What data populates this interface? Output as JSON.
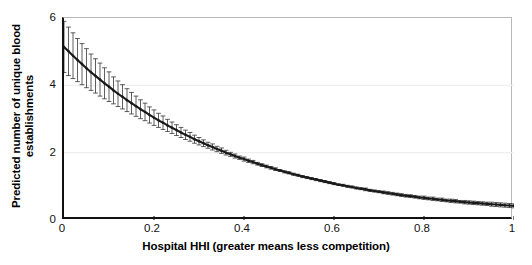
{
  "chart_data": {
    "type": "line",
    "title": "",
    "subtitle": "",
    "xlabel": "Hospital HHI (greater means less competition)",
    "ylabel": "Predicted number of unique blood establishments",
    "ylabel_line1": "Predicted number of unique blood",
    "ylabel_line2": "establishments",
    "xlim": [
      0,
      1
    ],
    "ylim": [
      0,
      6
    ],
    "xticks": [
      0,
      0.2,
      0.4,
      0.6,
      0.8,
      1
    ],
    "xticklabels": [
      "0",
      "0.2",
      "0.4",
      "0.6",
      "0.8",
      "1"
    ],
    "yticks": [
      0,
      2,
      4,
      6
    ],
    "yticklabels": [
      "0",
      "2",
      "4",
      "6"
    ],
    "grid": "horizontal-faint",
    "legend": "none",
    "markers": "small filled circles",
    "errorbars": "capped vertical 95% confidence intervals at every point",
    "series": [
      {
        "name": "Predicted number of unique blood establishments",
        "color": "#1a1a1a",
        "x": [
          0.0,
          0.01,
          0.02,
          0.03,
          0.04,
          0.05,
          0.06,
          0.07,
          0.08,
          0.09,
          0.1,
          0.11,
          0.12,
          0.13,
          0.14,
          0.15,
          0.16,
          0.17,
          0.18,
          0.19,
          0.2,
          0.21,
          0.22,
          0.23,
          0.24,
          0.25,
          0.26,
          0.27,
          0.28,
          0.29,
          0.3,
          0.31,
          0.32,
          0.33,
          0.34,
          0.35,
          0.36,
          0.37,
          0.38,
          0.39,
          0.4,
          0.41,
          0.42,
          0.43,
          0.44,
          0.45,
          0.46,
          0.47,
          0.48,
          0.49,
          0.5,
          0.51,
          0.52,
          0.53,
          0.54,
          0.55,
          0.56,
          0.57,
          0.58,
          0.59,
          0.6,
          0.61,
          0.62,
          0.63,
          0.64,
          0.65,
          0.66,
          0.67,
          0.68,
          0.69,
          0.7,
          0.71,
          0.72,
          0.73,
          0.74,
          0.75,
          0.76,
          0.77,
          0.78,
          0.79,
          0.8,
          0.81,
          0.82,
          0.83,
          0.84,
          0.85,
          0.86,
          0.87,
          0.88,
          0.89,
          0.9,
          0.91,
          0.92,
          0.93,
          0.94,
          0.95,
          0.96,
          0.97,
          0.98,
          0.99,
          1.0
        ],
        "y": [
          5.14,
          5.01,
          4.88,
          4.75,
          4.63,
          4.51,
          4.39,
          4.28,
          4.17,
          4.06,
          3.96,
          3.85,
          3.75,
          3.66,
          3.56,
          3.47,
          3.38,
          3.29,
          3.21,
          3.12,
          3.04,
          2.96,
          2.89,
          2.81,
          2.74,
          2.67,
          2.6,
          2.53,
          2.47,
          2.4,
          2.34,
          2.28,
          2.22,
          2.17,
          2.11,
          2.06,
          2.0,
          1.95,
          1.9,
          1.85,
          1.81,
          1.76,
          1.72,
          1.67,
          1.63,
          1.59,
          1.55,
          1.51,
          1.47,
          1.43,
          1.4,
          1.36,
          1.33,
          1.29,
          1.26,
          1.23,
          1.2,
          1.17,
          1.14,
          1.11,
          1.08,
          1.05,
          1.03,
          1.0,
          0.98,
          0.95,
          0.93,
          0.91,
          0.88,
          0.86,
          0.84,
          0.82,
          0.8,
          0.78,
          0.76,
          0.74,
          0.72,
          0.71,
          0.69,
          0.67,
          0.66,
          0.64,
          0.63,
          0.61,
          0.6,
          0.58,
          0.57,
          0.56,
          0.54,
          0.53,
          0.52,
          0.51,
          0.5,
          0.49,
          0.48,
          0.47,
          0.46,
          0.45,
          0.44,
          0.43,
          0.42
        ],
        "ci_low": [
          4.38,
          4.29,
          4.2,
          4.11,
          4.02,
          3.93,
          3.85,
          3.77,
          3.68,
          3.6,
          3.52,
          3.45,
          3.37,
          3.3,
          3.22,
          3.15,
          3.08,
          3.01,
          2.95,
          2.88,
          2.81,
          2.75,
          2.69,
          2.63,
          2.57,
          2.51,
          2.45,
          2.39,
          2.34,
          2.28,
          2.23,
          2.18,
          2.13,
          2.08,
          2.03,
          1.98,
          1.93,
          1.89,
          1.84,
          1.8,
          1.75,
          1.71,
          1.67,
          1.63,
          1.59,
          1.55,
          1.51,
          1.47,
          1.44,
          1.4,
          1.37,
          1.33,
          1.3,
          1.26,
          1.23,
          1.2,
          1.17,
          1.14,
          1.11,
          1.08,
          1.05,
          1.03,
          1.0,
          0.97,
          0.95,
          0.92,
          0.9,
          0.87,
          0.85,
          0.83,
          0.81,
          0.78,
          0.76,
          0.74,
          0.72,
          0.7,
          0.68,
          0.67,
          0.65,
          0.63,
          0.61,
          0.6,
          0.58,
          0.57,
          0.55,
          0.54,
          0.52,
          0.51,
          0.5,
          0.48,
          0.47,
          0.46,
          0.45,
          0.44,
          0.43,
          0.41,
          0.4,
          0.39,
          0.38,
          0.37,
          0.36
        ],
        "ci_high": [
          5.9,
          5.73,
          5.56,
          5.39,
          5.24,
          5.09,
          4.93,
          4.79,
          4.66,
          4.52,
          4.4,
          4.25,
          4.13,
          4.02,
          3.9,
          3.79,
          3.68,
          3.57,
          3.47,
          3.36,
          3.27,
          3.17,
          3.09,
          2.99,
          2.91,
          2.83,
          2.75,
          2.67,
          2.6,
          2.52,
          2.45,
          2.38,
          2.31,
          2.26,
          2.19,
          2.14,
          2.07,
          2.01,
          1.96,
          1.9,
          1.87,
          1.81,
          1.77,
          1.71,
          1.67,
          1.63,
          1.59,
          1.55,
          1.5,
          1.46,
          1.43,
          1.39,
          1.36,
          1.32,
          1.29,
          1.26,
          1.23,
          1.2,
          1.17,
          1.14,
          1.11,
          1.07,
          1.06,
          1.03,
          1.01,
          0.98,
          0.96,
          0.95,
          0.91,
          0.89,
          0.87,
          0.86,
          0.84,
          0.82,
          0.8,
          0.78,
          0.76,
          0.75,
          0.73,
          0.71,
          0.71,
          0.68,
          0.68,
          0.65,
          0.65,
          0.62,
          0.62,
          0.61,
          0.58,
          0.58,
          0.57,
          0.56,
          0.55,
          0.54,
          0.53,
          0.53,
          0.52,
          0.51,
          0.5,
          0.49,
          0.48
        ]
      }
    ]
  },
  "axes": {
    "ytick_labels": [
      "6",
      "4",
      "2",
      "0"
    ],
    "xtick_labels": [
      "0",
      "0.2",
      "0.4",
      "0.6",
      "0.8",
      "1"
    ],
    "xlabel": "Hospital HHI (greater means less competition)",
    "ylabel_line1": "Predicted number of unique blood",
    "ylabel_line2": "establishments"
  },
  "colors": {
    "line": "#1a1a1a",
    "errorbar": "#2a2a2a",
    "axis": "#111111",
    "frame": "#b9b9b9",
    "grid": "#efefef",
    "background": "#ffffff"
  }
}
